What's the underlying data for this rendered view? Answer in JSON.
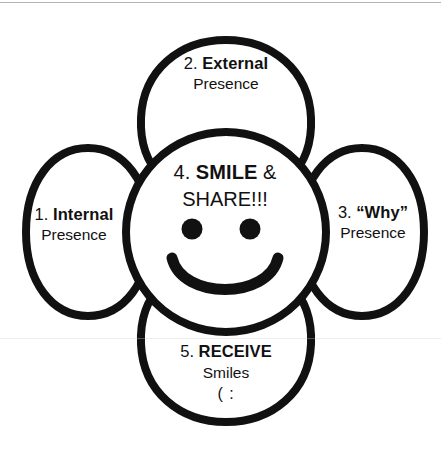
{
  "diagram": {
    "type": "flower-petal-process-diagram",
    "stroke_color": "#111111",
    "fill_color": "#ffffff",
    "background_color": "#ffffff",
    "petal_count": 4,
    "center": {
      "name": "SMILE & SHARE",
      "step_number": "4.",
      "title_bold": "SMILE",
      "title_rest": " &",
      "line_two": "SHARE!!!",
      "face": {
        "left_eye": "filled-circle",
        "right_eye": "filled-circle",
        "mouth": "smile-arc"
      }
    },
    "petals": {
      "top": {
        "step_number": "2.",
        "title": "External",
        "subtitle": "Presence"
      },
      "left": {
        "step_number": "1.",
        "title": "Internal",
        "subtitle": "Presence"
      },
      "right": {
        "step_number": "3.",
        "title": "“Why”",
        "subtitle": "Presence"
      },
      "bottom": {
        "step_number": "5.",
        "title": "RECEIVE",
        "subtitle": "Smiles",
        "emoticon": "( :"
      }
    }
  }
}
